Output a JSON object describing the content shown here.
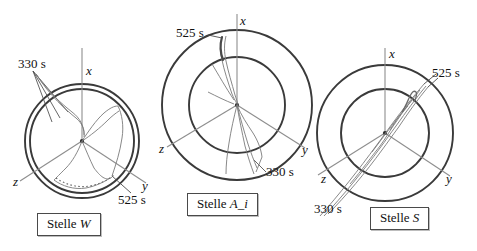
{
  "figure": {
    "type": "polar-trajectory-diagram-set",
    "background_color": "#ffffff",
    "ink_color": "#333333",
    "trace_color": "#6e6e6e",
    "axis_color": "#8c8c8c",
    "panel_count": 3
  },
  "panels": [
    {
      "id": "stelle-w",
      "caption_prefix": "Stelle ",
      "caption_symbol": "W",
      "axes": {
        "x": "x",
        "y": "y",
        "z": "z"
      },
      "annotations": [
        {
          "id": "w-330",
          "text": "330 s"
        },
        {
          "id": "w-525",
          "text": "525 s"
        }
      ],
      "circles": {
        "count": 2,
        "style": "closely-spaced concentric rings"
      }
    },
    {
      "id": "stelle-a-i",
      "caption_prefix": "Stelle ",
      "caption_symbol": "A_i",
      "axes": {
        "x": "x",
        "y": "y",
        "z": "z"
      },
      "annotations": [
        {
          "id": "ai-525",
          "text": "525 s"
        },
        {
          "id": "ai-330",
          "text": "330 s"
        }
      ],
      "circles": {
        "count": 2,
        "style": "widely-spaced concentric rings"
      }
    },
    {
      "id": "stelle-s",
      "caption_prefix": "Stelle ",
      "caption_symbol": "S",
      "axes": {
        "x": "x",
        "y": "y",
        "z": "z"
      },
      "annotations": [
        {
          "id": "s-525",
          "text": "525 s"
        },
        {
          "id": "s-330",
          "text": "330 s"
        }
      ],
      "circles": {
        "count": 2,
        "style": "widely-spaced concentric rings"
      }
    }
  ]
}
